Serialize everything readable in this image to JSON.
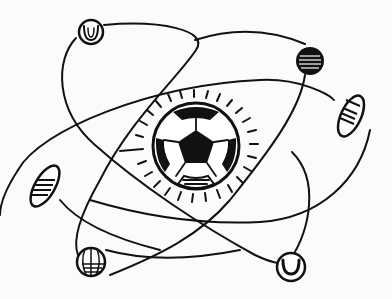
{
  "illustration": {
    "subject": "sports-atom",
    "nucleus": "soccer-ball",
    "electrons": [
      "tennis-ball",
      "basketball",
      "football",
      "football",
      "basketball",
      "tennis-ball"
    ],
    "colors": {
      "ink": "#111111",
      "paper": "#fbfbfb"
    }
  }
}
